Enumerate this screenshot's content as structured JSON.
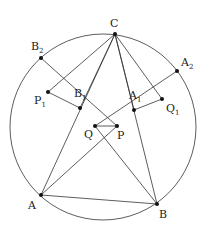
{
  "diagram": {
    "type": "geometry",
    "circle": {
      "cx": 103,
      "cy": 127,
      "r": 93
    },
    "points": [
      {
        "name": "C",
        "label": "C",
        "sub": "",
        "x": 115,
        "y": 34,
        "lx": 110,
        "ly": 27
      },
      {
        "name": "B2",
        "label": "B",
        "sub": "2",
        "x": 41,
        "y": 58,
        "lx": 31,
        "ly": 50
      },
      {
        "name": "A2",
        "label": "A",
        "sub": "2",
        "x": 177,
        "y": 71,
        "lx": 181,
        "ly": 66
      },
      {
        "name": "P1",
        "label": "P",
        "sub": "1",
        "x": 48,
        "y": 92,
        "lx": 34,
        "ly": 104
      },
      {
        "name": "B1",
        "label": "B",
        "sub": "1",
        "x": 80,
        "y": 108,
        "lx": 74,
        "ly": 97
      },
      {
        "name": "A1",
        "label": "A",
        "sub": "1",
        "x": 134,
        "y": 110,
        "lx": 129,
        "ly": 99
      },
      {
        "name": "Q1",
        "label": "Q",
        "sub": "1",
        "x": 162,
        "y": 99,
        "lx": 166,
        "ly": 112
      },
      {
        "name": "Q",
        "label": "Q",
        "sub": "",
        "x": 95,
        "y": 126,
        "lx": 84,
        "ly": 138
      },
      {
        "name": "P",
        "label": "P",
        "sub": "",
        "x": 117,
        "y": 126,
        "lx": 117,
        "ly": 139
      },
      {
        "name": "A",
        "label": "A",
        "sub": "",
        "x": 41,
        "y": 195,
        "lx": 28,
        "ly": 209
      },
      {
        "name": "B",
        "label": "B",
        "sub": "",
        "x": 157,
        "y": 204,
        "lx": 159,
        "ly": 218
      }
    ],
    "segments": [
      [
        "C",
        "A"
      ],
      [
        "C",
        "B"
      ],
      [
        "C",
        "B1"
      ],
      [
        "C",
        "A1"
      ],
      [
        "C",
        "P1"
      ],
      [
        "C",
        "Q1"
      ],
      [
        "A",
        "B"
      ],
      [
        "B2",
        "P"
      ],
      [
        "A2",
        "Q"
      ],
      [
        "P1",
        "B1"
      ],
      [
        "Q1",
        "A1"
      ],
      [
        "A",
        "P"
      ],
      [
        "B",
        "Q"
      ],
      [
        "Q",
        "P"
      ]
    ]
  }
}
